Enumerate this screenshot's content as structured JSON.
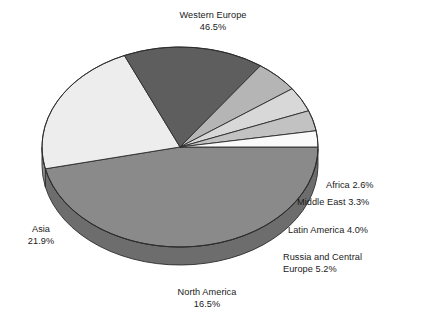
{
  "chart_data": {
    "type": "pie",
    "title": "",
    "subtitle": "",
    "xlabel": "",
    "ylabel": "",
    "legend_position": "none",
    "grid": false,
    "style": "3d-exploded-none-grayscale",
    "units": "percent",
    "total": 100.0,
    "categories": [
      "Western Europe",
      "Asia",
      "North America",
      "Russia and Central Europe",
      "Latin America",
      "Middle East",
      "Africa"
    ],
    "values": [
      46.5,
      21.9,
      16.5,
      5.2,
      4.0,
      3.3,
      2.6
    ],
    "slices": [
      {
        "name": "Western Europe",
        "value": 46.5,
        "label": "Western Europe",
        "percent_text": "46.5%",
        "color": "#8a8a8a",
        "side_color": "#6d6d6d"
      },
      {
        "name": "Asia",
        "value": 21.9,
        "label": "Asia",
        "percent_text": "21.9%",
        "color": "#ededed",
        "side_color": "#8f8f8f"
      },
      {
        "name": "North America",
        "value": 16.5,
        "label": "North America",
        "percent_text": "16.5%",
        "color": "#5e5e5e",
        "side_color": "#3f3f3f"
      },
      {
        "name": "Russia and Central Europe",
        "value": 5.2,
        "label": "Russia and Central Europe",
        "percent_text": "5.2%",
        "color": "#b5b5b5",
        "side_color": "#7d7d7d"
      },
      {
        "name": "Latin America",
        "value": 4.0,
        "label": "Latin America",
        "percent_text": "4.0%",
        "color": "#d8d8d8",
        "side_color": "#707070"
      },
      {
        "name": "Middle East",
        "value": 3.3,
        "label": "Middle East",
        "percent_text": "3.3%",
        "color": "#c2c2c2",
        "side_color": "#6a6a6a"
      },
      {
        "name": "Africa",
        "value": 2.6,
        "label": "Africa",
        "percent_text": "2.6%",
        "color": "#fafafa",
        "side_color": "#5c5c5c"
      }
    ]
  },
  "labels": {
    "western_europe": {
      "line1": "Western Europe",
      "line2": "46.5%"
    },
    "asia": {
      "line1": "Asia",
      "line2": "21.9%"
    },
    "north_america": {
      "line1": "North America",
      "line2": "16.5%"
    },
    "africa": {
      "line1": "Africa 2.6%"
    },
    "middle_east": {
      "line1": "Middle East 3.3%"
    },
    "latin_america": {
      "line1": "Latin America 4.0%"
    },
    "russia": {
      "line1": "Russia and Central",
      "line2": "Europe 5.2%"
    }
  },
  "geometry": {
    "cx": 180,
    "cy": 147,
    "rx": 138,
    "ry": 100,
    "depth": 18,
    "start_angle_deg": 0
  }
}
